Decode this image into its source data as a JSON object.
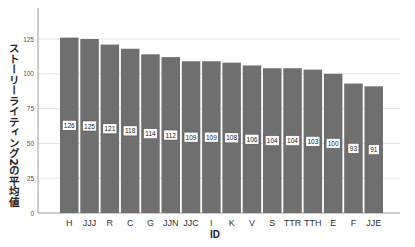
{
  "chart_data": {
    "type": "bar",
    "title": "",
    "xlabel": "ID",
    "ylabel": "ストーリーライティング2の平均値",
    "categories": [
      "H",
      "JJJ",
      "R",
      "C",
      "G",
      "JJN",
      "JJC",
      "I",
      "K",
      "V",
      "S",
      "TTR",
      "TTH",
      "E",
      "F",
      "JJE"
    ],
    "values": [
      126,
      125,
      121,
      118,
      114,
      112,
      109,
      109,
      108,
      106,
      104,
      104,
      103,
      100,
      93,
      91
    ],
    "data_labels": [
      "126",
      "125",
      "121",
      "118",
      "114",
      "112",
      "109",
      "109",
      "108",
      "106",
      "104",
      "104",
      "103",
      "100",
      "93",
      "91"
    ],
    "yticks": [
      0,
      25,
      50,
      75,
      100,
      125
    ],
    "ylim": [
      0,
      150
    ],
    "grid": true,
    "legend": "none",
    "colors": {
      "bar": "#6f6f6f",
      "grid": "#e3e3e3",
      "axis": "#9a9a9a",
      "label_bg": "#ffffff"
    }
  }
}
